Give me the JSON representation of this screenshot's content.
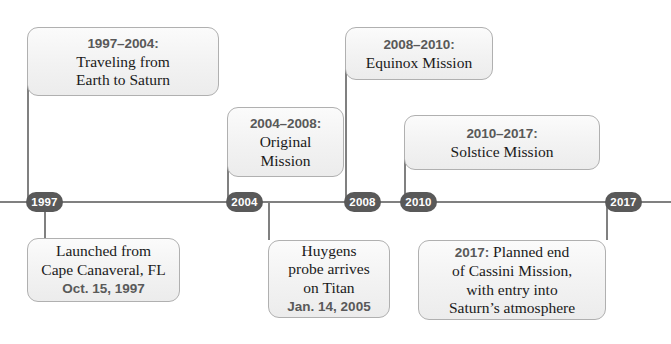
{
  "diagram": {
    "axis_color": "#808080",
    "pill_color": "#595959",
    "header_color": "#595959",
    "body_color": "#1a1a1a"
  },
  "markers": [
    {
      "year": "1997",
      "x": 26
    },
    {
      "year": "2004",
      "x": 226
    },
    {
      "year": "2008",
      "x": 344
    },
    {
      "year": "2010",
      "x": 400
    },
    {
      "year": "2017",
      "x": 605
    }
  ],
  "above_boxes": [
    {
      "header": "1997–2004:",
      "lines": [
        "Traveling from",
        "Earth to Saturn"
      ]
    },
    {
      "header": "2004–2008:",
      "lines": [
        "Original",
        "Mission"
      ]
    },
    {
      "header": "2008–2010:",
      "lines": [
        "Equinox Mission"
      ]
    },
    {
      "header": "2010–2017:",
      "lines": [
        "Solstice Mission"
      ]
    }
  ],
  "below_boxes": [
    {
      "lines": [
        "Launched from",
        "Cape Canaveral, FL"
      ],
      "date": "Oct. 15, 1997"
    },
    {
      "lines": [
        "Huygens",
        "probe arrives",
        "on Titan"
      ],
      "date": "Jan. 14, 2005"
    },
    {
      "inline_year": "2017:",
      "inline_rest": " Planned end",
      "lines": [
        "of Cassini Mission,",
        "with entry into",
        "Saturn’s atmosphere"
      ]
    }
  ]
}
